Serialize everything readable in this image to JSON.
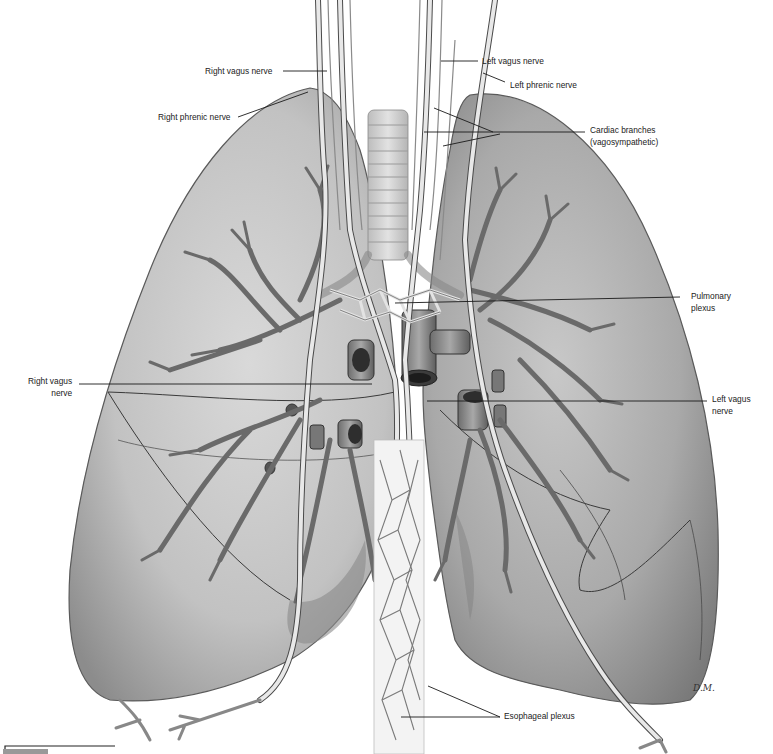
{
  "figure": {
    "colors": {
      "lung_fill": "#b9b9b9",
      "lung_shadow": "#8f8f8f",
      "nerve": "#e6e6e6",
      "outline": "#3a3a3a",
      "background": "#ffffff",
      "label_text": "#222222"
    },
    "artist_initials": "D.M."
  },
  "labels": {
    "right_vagus_nerve_top": "Right vagus nerve",
    "right_phrenic_nerve": "Right phrenic nerve",
    "left_vagus_nerve_top": "Left vagus nerve",
    "left_phrenic_nerve": "Left phrenic nerve",
    "cardiac_branches_line1": "Cardiac branches",
    "cardiac_branches_line2": "(vagosympathetic)",
    "pulmonary_plexus_line1": "Pulmonary",
    "pulmonary_plexus_line2": "plexus",
    "right_vagus_nerve_mid_line1": "Right vagus",
    "right_vagus_nerve_mid_line2": "nerve",
    "left_vagus_nerve_mid_line1": "Left vagus",
    "left_vagus_nerve_mid_line2": "nerve",
    "esophageal_plexus": "Esophageal plexus"
  }
}
